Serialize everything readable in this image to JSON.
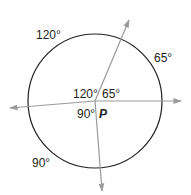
{
  "diagram": {
    "type": "circle-with-central-angles",
    "center_label": "P",
    "central_angles": [
      {
        "label": "120°",
        "position": "upper-left"
      },
      {
        "label": "65°",
        "position": "upper-right"
      },
      {
        "label": "90°",
        "position": "lower-left"
      }
    ],
    "arc_labels": [
      {
        "label": "120°",
        "position": "upper-left-arc"
      },
      {
        "label": "65°",
        "position": "right-arc"
      },
      {
        "label": "90°",
        "position": "lower-left-arc"
      }
    ],
    "colors": {
      "circle": "#231f20",
      "rays": "#9a9a9a",
      "text": "#231f20"
    }
  }
}
